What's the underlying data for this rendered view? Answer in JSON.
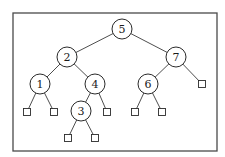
{
  "diagram": {
    "type": "binary-search-tree",
    "root": "5",
    "nodes": [
      {
        "id": "5",
        "label": "5"
      },
      {
        "id": "2",
        "label": "2"
      },
      {
        "id": "7",
        "label": "7"
      },
      {
        "id": "1",
        "label": "1"
      },
      {
        "id": "4",
        "label": "4"
      },
      {
        "id": "6",
        "label": "6"
      },
      {
        "id": "3",
        "label": "3"
      }
    ],
    "leaves": [
      {
        "id": "L1a",
        "parent": "1",
        "side": "left"
      },
      {
        "id": "L1b",
        "parent": "1",
        "side": "right"
      },
      {
        "id": "L4b",
        "parent": "4",
        "side": "right"
      },
      {
        "id": "L3a",
        "parent": "3",
        "side": "left"
      },
      {
        "id": "L3b",
        "parent": "3",
        "side": "right"
      },
      {
        "id": "L6a",
        "parent": "6",
        "side": "left"
      },
      {
        "id": "L6b",
        "parent": "6",
        "side": "right"
      },
      {
        "id": "L7b",
        "parent": "7",
        "side": "right"
      }
    ],
    "edges": [
      {
        "from": "5",
        "to": "2"
      },
      {
        "from": "5",
        "to": "7"
      },
      {
        "from": "2",
        "to": "1"
      },
      {
        "from": "2",
        "to": "4"
      },
      {
        "from": "4",
        "to": "3"
      },
      {
        "from": "7",
        "to": "6"
      },
      {
        "from": "1",
        "to": "L1a"
      },
      {
        "from": "1",
        "to": "L1b"
      },
      {
        "from": "4",
        "to": "L4b"
      },
      {
        "from": "3",
        "to": "L3a"
      },
      {
        "from": "3",
        "to": "L3b"
      },
      {
        "from": "6",
        "to": "L6a"
      },
      {
        "from": "6",
        "to": "L6b"
      },
      {
        "from": "7",
        "to": "L7b"
      }
    ]
  }
}
